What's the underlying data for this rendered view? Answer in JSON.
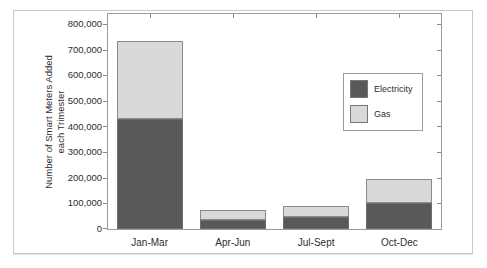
{
  "window": {
    "background": "#ffffff",
    "frame_color": "#c9c9c9"
  },
  "chart_data": {
    "type": "bar",
    "stacked": true,
    "title": "",
    "categories": [
      "Jan-Mar",
      "Apr-Jun",
      "Jul-Sept",
      "Oct-Dec"
    ],
    "series": [
      {
        "name": "Electricity",
        "color": "#595959",
        "edge_color": "#6e6e6e",
        "values": [
          430000,
          35000,
          45000,
          100000
        ]
      },
      {
        "name": "Gas",
        "color": "#d9d9d9",
        "edge_color": "#8a8a8a",
        "values": [
          305000,
          40000,
          45000,
          95000
        ]
      }
    ],
    "totals": [
      735000,
      75000,
      90000,
      195000
    ],
    "xlabel": "",
    "ylabel_line1": "Number of Smart Meters Added",
    "ylabel_line2": "each Trimester",
    "ylim": [
      0,
      800000
    ],
    "ytick_interval": 100000,
    "ytick_labels": [
      "0",
      "100,000",
      "200,000",
      "300,000",
      "400,000",
      "500,000",
      "600,000",
      "700,000",
      "800,000"
    ],
    "grid": false,
    "legend": {
      "position": "middle-right",
      "entries": [
        "Electricity",
        "Gas"
      ]
    }
  }
}
